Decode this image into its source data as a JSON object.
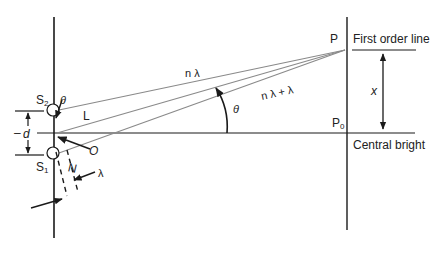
{
  "diagram": {
    "colors": {
      "line": "#1a1a1a",
      "ray": "#8a8a8a",
      "background": "#ffffff"
    },
    "labels": {
      "s2": "S",
      "s2_sub": "2",
      "s1": "S",
      "s1_sub": "1",
      "theta_slit": "θ",
      "L": "L",
      "d": "d",
      "d_dash": "–",
      "O": "O",
      "N": "N",
      "lambda_small": "λ",
      "n_lambda": "n λ",
      "n_lambda_plus": "n λ  +    λ",
      "theta_angle": "θ",
      "P": "P",
      "P0": "P",
      "P0_sub": "0",
      "x": "x",
      "first_order_line": "First order line",
      "central_bright": "Central bright"
    }
  }
}
